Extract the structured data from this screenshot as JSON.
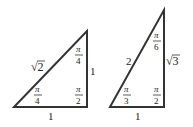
{
  "diagram": {
    "triangles": [
      {
        "name": "45-45-90",
        "vertices": [
          [
            14,
            107
          ],
          [
            87,
            107
          ],
          [
            87,
            31
          ]
        ],
        "sides": {
          "hypotenuse": "√2",
          "vertical": "1",
          "base": "1"
        },
        "angles": {
          "top": {
            "num": "π",
            "den": "4"
          },
          "bottom_left": {
            "num": "π",
            "den": "4"
          },
          "right": {
            "num": "π",
            "den": "2"
          }
        }
      },
      {
        "name": "30-60-90",
        "vertices": [
          [
            110,
            107
          ],
          [
            164,
            107
          ],
          [
            164,
            10
          ]
        ],
        "sides": {
          "hypotenuse": "2",
          "vertical": "√3",
          "base": "1"
        },
        "angles": {
          "top": {
            "num": "π",
            "den": "6"
          },
          "bottom_left": {
            "num": "π",
            "den": "3"
          },
          "right": {
            "num": "π",
            "den": "2"
          }
        }
      }
    ],
    "colors": {
      "stroke": "#333333",
      "text": "#222222",
      "background": "#ffffff"
    }
  }
}
